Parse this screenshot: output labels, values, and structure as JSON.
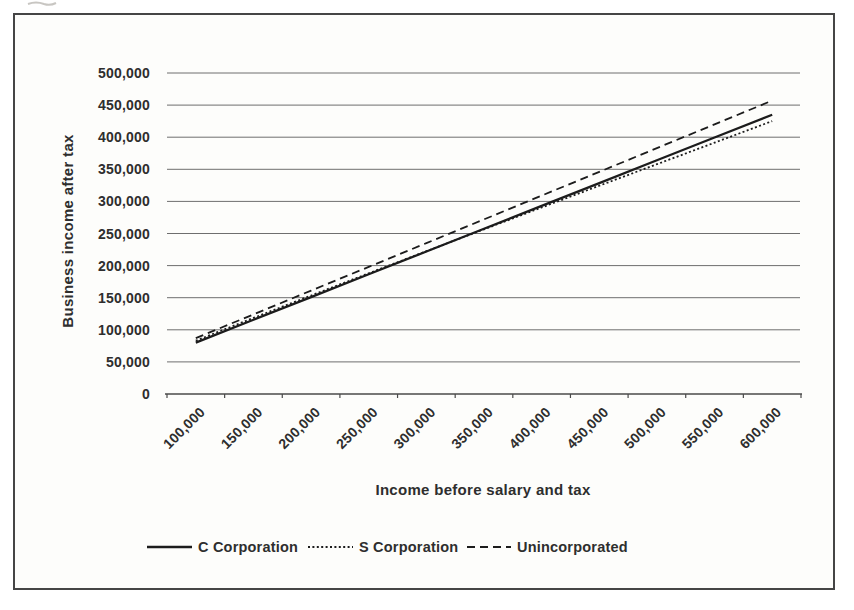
{
  "panel": {
    "background": "#fdfdfb",
    "border_color": "#454545"
  },
  "chart_data": {
    "type": "line",
    "title": "",
    "xlabel": "Income before salary and tax",
    "ylabel": "Business income after tax",
    "ylim": [
      0,
      500000
    ],
    "y_tick_step": 50000,
    "grid": "horizontal",
    "legend_position": "bottom",
    "line_color": "#1c1c1c",
    "gridline_color": "#6e6e6e",
    "axis_color": "#4a4a4a",
    "y_ticks": [
      {
        "value": 0,
        "label": "0"
      },
      {
        "value": 50000,
        "label": "50,000"
      },
      {
        "value": 100000,
        "label": "100,000"
      },
      {
        "value": 150000,
        "label": "150,000"
      },
      {
        "value": 200000,
        "label": "200,000"
      },
      {
        "value": 250000,
        "label": "250,000"
      },
      {
        "value": 300000,
        "label": "300,000"
      },
      {
        "value": 350000,
        "label": "350,000"
      },
      {
        "value": 400000,
        "label": "400,000"
      },
      {
        "value": 450000,
        "label": "450,000"
      },
      {
        "value": 500000,
        "label": "500,000"
      }
    ],
    "categories": [
      {
        "value": 100000,
        "label": "100,000"
      },
      {
        "value": 150000,
        "label": "150,000"
      },
      {
        "value": 200000,
        "label": "200,000"
      },
      {
        "value": 250000,
        "label": "250,000"
      },
      {
        "value": 300000,
        "label": "300,000"
      },
      {
        "value": 350000,
        "label": "350,000"
      },
      {
        "value": 400000,
        "label": "400,000"
      },
      {
        "value": 450000,
        "label": "450,000"
      },
      {
        "value": 500000,
        "label": "500,000"
      },
      {
        "value": 550000,
        "label": "550,000"
      },
      {
        "value": 600000,
        "label": "600,000"
      }
    ],
    "series": [
      {
        "name": "C Corporation",
        "dash": "solid",
        "values": [
          80000,
          115500,
          151000,
          186500,
          222000,
          257500,
          293000,
          328500,
          364000,
          399500,
          435000
        ]
      },
      {
        "name": "S Corporation",
        "dash": "dotted",
        "values": [
          83000,
          118500,
          153500,
          188000,
          222500,
          256500,
          290500,
          324500,
          358000,
          391500,
          425000
        ]
      },
      {
        "name": "Unincorporated",
        "dash": "dashed",
        "values": [
          87000,
          124000,
          161000,
          198000,
          235000,
          272000,
          309000,
          346000,
          383000,
          420000,
          457000
        ]
      }
    ]
  }
}
